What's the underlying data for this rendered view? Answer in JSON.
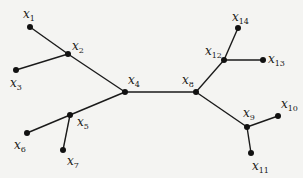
{
  "diagram": {
    "type": "tree",
    "nodes": [
      {
        "id": "x1",
        "base": "x",
        "sub": "1",
        "x": 30,
        "y": 27,
        "lx": 23,
        "ly": 18
      },
      {
        "id": "x2",
        "base": "x",
        "sub": "2",
        "x": 68,
        "y": 54,
        "lx": 72,
        "ly": 50
      },
      {
        "id": "x3",
        "base": "x",
        "sub": "3",
        "x": 16,
        "y": 70,
        "lx": 10,
        "ly": 87
      },
      {
        "id": "x4",
        "base": "x",
        "sub": "4",
        "x": 125,
        "y": 92,
        "lx": 128,
        "ly": 84
      },
      {
        "id": "x5",
        "base": "x",
        "sub": "5",
        "x": 70,
        "y": 115,
        "lx": 77,
        "ly": 126
      },
      {
        "id": "x6",
        "base": "x",
        "sub": "6",
        "x": 27,
        "y": 133,
        "lx": 14,
        "ly": 149
      },
      {
        "id": "x7",
        "base": "x",
        "sub": "7",
        "x": 63,
        "y": 150,
        "lx": 67,
        "ly": 165
      },
      {
        "id": "x8",
        "base": "x",
        "sub": "8",
        "x": 196,
        "y": 92,
        "lx": 182,
        "ly": 84
      },
      {
        "id": "x9",
        "base": "x",
        "sub": "9",
        "x": 247,
        "y": 127,
        "lx": 243,
        "ly": 117
      },
      {
        "id": "x10",
        "base": "x",
        "sub": "10",
        "x": 278,
        "y": 116,
        "lx": 281,
        "ly": 108
      },
      {
        "id": "x11",
        "base": "x",
        "sub": "11",
        "x": 251,
        "y": 153,
        "lx": 252,
        "ly": 170
      },
      {
        "id": "x12",
        "base": "x",
        "sub": "12",
        "x": 224,
        "y": 60,
        "lx": 205,
        "ly": 55
      },
      {
        "id": "x13",
        "base": "x",
        "sub": "13",
        "x": 263,
        "y": 60,
        "lx": 268,
        "ly": 63
      },
      {
        "id": "x14",
        "base": "x",
        "sub": "14",
        "x": 238,
        "y": 28,
        "lx": 232,
        "ly": 21
      }
    ],
    "edges": [
      [
        "x1",
        "x2"
      ],
      [
        "x3",
        "x2"
      ],
      [
        "x2",
        "x4"
      ],
      [
        "x4",
        "x5"
      ],
      [
        "x5",
        "x6"
      ],
      [
        "x5",
        "x7"
      ],
      [
        "x4",
        "x8"
      ],
      [
        "x8",
        "x12"
      ],
      [
        "x12",
        "x14"
      ],
      [
        "x12",
        "x13"
      ],
      [
        "x8",
        "x9"
      ],
      [
        "x9",
        "x10"
      ],
      [
        "x9",
        "x11"
      ]
    ]
  }
}
